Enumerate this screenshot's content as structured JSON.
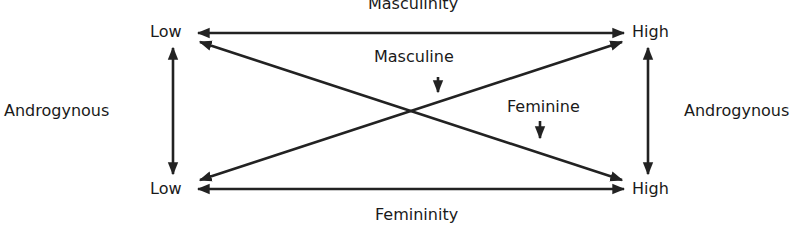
{
  "diagram": {
    "top_axis_label": "Masculinity",
    "bottom_axis_label": "Femininity",
    "top_left": "Low",
    "top_right": "High",
    "bottom_left": "Low",
    "bottom_right": "High",
    "left_side_label": "Androgynous",
    "right_side_label": "Androgynous",
    "masculine_label": "Masculine",
    "feminine_label": "Feminine",
    "line_color": "#222222"
  }
}
